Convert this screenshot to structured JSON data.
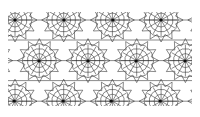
{
  "figure": {
    "colors": {
      "background": "#ffffff",
      "line": "#2a2a2a",
      "center": "#111111"
    },
    "area": {
      "x": 8,
      "y": 12,
      "width": 184,
      "height": 94
    },
    "rosette_centers": [
      [
        7,
        8
      ],
      [
        56,
        8
      ],
      [
        105,
        8
      ],
      [
        153,
        8
      ],
      [
        31,
        49
      ],
      [
        80,
        49
      ],
      [
        128,
        49
      ],
      [
        177,
        49
      ],
      [
        6,
        89
      ],
      [
        55,
        89
      ],
      [
        103,
        89
      ],
      [
        152,
        89
      ]
    ]
  }
}
